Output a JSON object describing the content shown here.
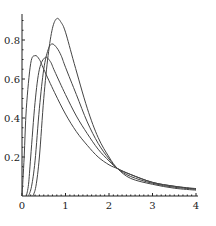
{
  "chart_data": {
    "type": "line",
    "title": "",
    "xlabel": "",
    "ylabel": "",
    "xlim": [
      0,
      4
    ],
    "ylim": [
      0,
      0.92
    ],
    "grid": false,
    "legend": null,
    "x_ticks": [
      "0",
      "1",
      "2",
      "3",
      "4"
    ],
    "y_ticks": [
      "0.2",
      "0.4",
      "0.6",
      "0.8"
    ],
    "series": [
      {
        "name": "curve-1",
        "x": [
          0,
          0.05,
          0.1,
          0.2,
          0.3,
          0.4,
          0.5,
          0.75,
          1.0,
          1.25,
          1.5,
          1.75,
          2.0,
          2.2,
          2.5,
          3.0,
          3.5,
          4.0
        ],
        "y": [
          0,
          0.2,
          0.45,
          0.68,
          0.72,
          0.7,
          0.65,
          0.53,
          0.42,
          0.33,
          0.26,
          0.2,
          0.16,
          0.14,
          0.11,
          0.07,
          0.05,
          0.035
        ]
      },
      {
        "name": "curve-2",
        "x": [
          0.1,
          0.15,
          0.2,
          0.3,
          0.4,
          0.53,
          0.65,
          0.75,
          1.0,
          1.25,
          1.5,
          1.75,
          2.0,
          2.2,
          2.5,
          3.0,
          3.5,
          4.0
        ],
        "y": [
          0,
          0.06,
          0.2,
          0.48,
          0.65,
          0.71,
          0.69,
          0.64,
          0.52,
          0.41,
          0.32,
          0.24,
          0.18,
          0.14,
          0.11,
          0.07,
          0.05,
          0.038
        ]
      },
      {
        "name": "curve-3",
        "x": [
          0.15,
          0.22,
          0.3,
          0.4,
          0.5,
          0.6,
          0.69,
          0.8,
          0.9,
          1.0,
          1.25,
          1.5,
          1.75,
          2.0,
          2.2,
          2.5,
          3.0,
          3.5,
          4.0
        ],
        "y": [
          0,
          0.05,
          0.18,
          0.45,
          0.65,
          0.75,
          0.78,
          0.76,
          0.72,
          0.66,
          0.52,
          0.38,
          0.27,
          0.19,
          0.14,
          0.1,
          0.065,
          0.045,
          0.035
        ]
      },
      {
        "name": "curve-4",
        "x": [
          0.25,
          0.32,
          0.4,
          0.5,
          0.6,
          0.7,
          0.8,
          0.9,
          1.0,
          1.2,
          1.5,
          1.75,
          2.0,
          2.2,
          2.5,
          3.0,
          3.5,
          4.0
        ],
        "y": [
          0,
          0.05,
          0.2,
          0.5,
          0.72,
          0.86,
          0.91,
          0.89,
          0.84,
          0.68,
          0.45,
          0.3,
          0.2,
          0.14,
          0.09,
          0.06,
          0.04,
          0.03
        ]
      }
    ]
  }
}
